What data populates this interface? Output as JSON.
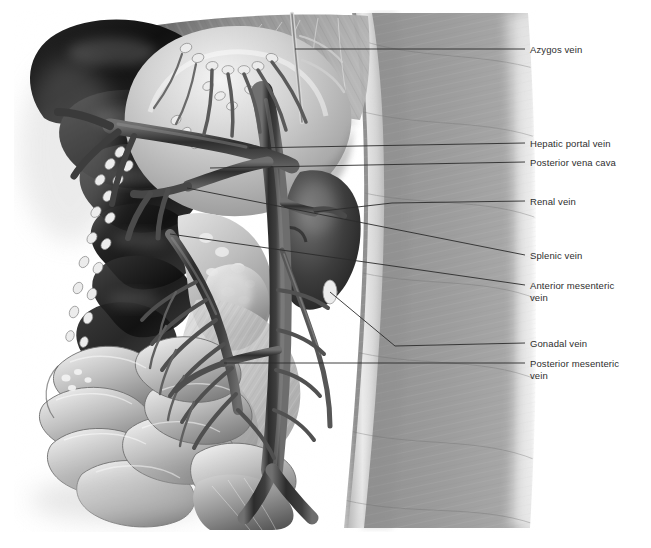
{
  "figure": {
    "kind": "anatomical-illustration",
    "render_style": "airbrush grayscale",
    "background_color": "#ffffff",
    "text_color": "#2e2e2e",
    "leader_color": "#2b2b2b",
    "canvas": {
      "width": 651,
      "height": 548
    },
    "art_bounds": {
      "x": 18,
      "y": 13,
      "width": 512,
      "height": 515
    }
  },
  "palette": {
    "liver_dark": "#141414",
    "liver_mid": "#2a2a2a",
    "stomach_light": "#d8d8d8",
    "body_wall": "#9a9a9a",
    "body_wall_edge": "#e8e8e8",
    "vessel_dark": "#3c3c3c",
    "vessel_mid": "#5e5e5e",
    "intestine_light": "#c9c9c9",
    "mesentery": "#b5b5b5",
    "highlight": "#f2f2f2",
    "kidney": "#4a4a4a"
  },
  "labels": [
    {
      "id": "azygos-vein",
      "text": "Azygos vein",
      "text_x": 530,
      "text_y": 44,
      "leader": "M295,49 L525,49"
    },
    {
      "id": "hepatic-portal-vein",
      "text": "Hepatic portal vein",
      "text_x": 530,
      "text_y": 138,
      "leader": "M249,148 L525,143"
    },
    {
      "id": "posterior-vena-cava",
      "text": "Posterior vena cava",
      "text_x": 530,
      "text_y": 157,
      "leader": "M210,168 L525,162"
    },
    {
      "id": "renal-vein",
      "text": "Renal vein",
      "text_x": 530,
      "text_y": 196,
      "leader": "M314,212 L392,203 L525,201"
    },
    {
      "id": "splenic-vein",
      "text": "Splenic vein",
      "text_x": 530,
      "text_y": 250,
      "leader": "M187,188 L525,255"
    },
    {
      "id": "anterior-mesenteric-vein",
      "text": "Anterior mesenteric\nvein",
      "text_x": 530,
      "text_y": 280,
      "leader": "M170,234 L525,285"
    },
    {
      "id": "gonadal-vein",
      "text": "Gonadal vein",
      "text_x": 530,
      "text_y": 338,
      "leader": "M330,292 L395,346 L525,343"
    },
    {
      "id": "posterior-mesenteric-vein",
      "text": "Posterior mesenteric\nvein",
      "text_x": 530,
      "text_y": 358,
      "leader": "M224,363 L525,363"
    }
  ]
}
